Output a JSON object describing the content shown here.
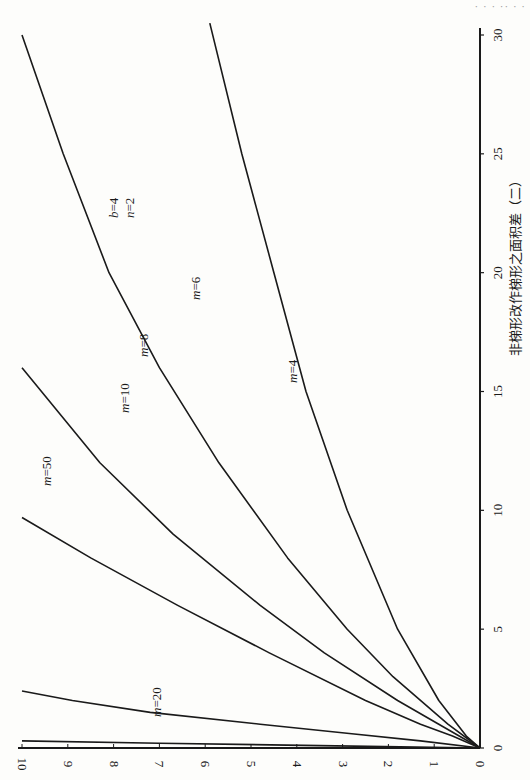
{
  "page": {
    "header_fragment": "· ·  · ·· · ·",
    "caption": "非梯形改作梯形之面积差（二）"
  },
  "chart_data": {
    "type": "line",
    "orientation": "rotated 90° clockwise (page rotated)",
    "title": "非梯形改作梯形之面积差（二）",
    "parameters_label": [
      "b=4",
      "n=2"
    ],
    "xlabel": "",
    "ylabel": "",
    "x_axis": {
      "range": [
        0,
        30
      ],
      "ticks": [
        0,
        5,
        10,
        15,
        20,
        25,
        30
      ]
    },
    "y_axis": {
      "range": [
        0,
        10
      ],
      "ticks": [
        0,
        1,
        2,
        3,
        4,
        5,
        6,
        7,
        8,
        9,
        10
      ]
    },
    "grid": false,
    "legend": "inline curve labels",
    "series": [
      {
        "name": "m=4",
        "label": "m=4",
        "x": [
          0,
          0.5,
          2,
          5,
          10,
          15,
          20,
          25,
          30.5
        ],
        "y": [
          0,
          0.3,
          0.9,
          1.8,
          2.9,
          3.8,
          4.5,
          5.2,
          5.9
        ]
      },
      {
        "name": "m=6",
        "label": "m=6",
        "x": [
          0,
          1,
          3,
          5,
          8,
          12,
          16,
          20,
          25,
          30
        ],
        "y": [
          0,
          0.7,
          1.9,
          2.9,
          4.2,
          5.7,
          7.0,
          8.1,
          9.1,
          10.0
        ]
      },
      {
        "name": "m=8",
        "label": "m=8",
        "x": [
          0,
          1,
          2,
          4,
          6,
          9,
          12,
          16
        ],
        "y": [
          0,
          0.9,
          1.8,
          3.4,
          4.8,
          6.7,
          8.3,
          10.0
        ]
      },
      {
        "name": "m=10",
        "label": "m=10",
        "x": [
          0,
          0.5,
          1,
          2,
          4,
          6,
          8,
          9.7
        ],
        "y": [
          0,
          0.6,
          1.3,
          2.5,
          4.6,
          6.6,
          8.5,
          10.0
        ]
      },
      {
        "name": "m=20",
        "label": "m=20",
        "x": [
          0,
          0.3,
          0.6,
          1.0,
          1.5,
          2.0,
          2.4
        ],
        "y": [
          0,
          1.3,
          2.8,
          4.8,
          7.2,
          8.9,
          10.0
        ]
      },
      {
        "name": "m=50",
        "label": "m=50",
        "x": [
          0,
          0.1,
          0.2,
          0.3
        ],
        "y": [
          0,
          3.5,
          7.0,
          10.0
        ]
      }
    ]
  }
}
